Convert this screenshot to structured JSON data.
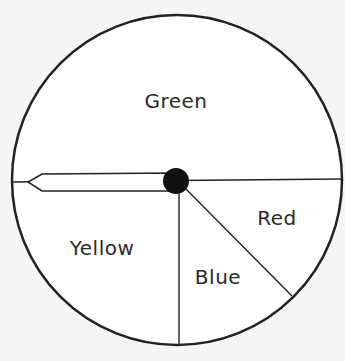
{
  "spinner": {
    "sections": [
      {
        "name": "green",
        "label": "Green"
      },
      {
        "name": "yellow",
        "label": "Yellow"
      },
      {
        "name": "blue",
        "label": "Blue"
      },
      {
        "name": "red",
        "label": "Red"
      }
    ]
  },
  "colors": {
    "background": "#f5f5f5",
    "wheel_fill": "#ffffff",
    "stroke": "#222222",
    "hub": "#111111"
  }
}
